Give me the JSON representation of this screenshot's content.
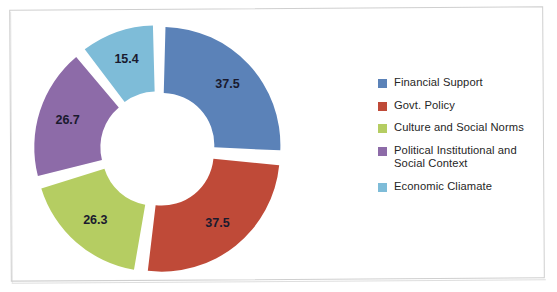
{
  "chart_data": {
    "type": "pie",
    "variant": "doughnut-exploded",
    "title": "",
    "subtitle": "",
    "xlabel": "",
    "ylabel": "",
    "grid": false,
    "legend_position": "right",
    "categories": [
      "Financial Support",
      "Govt. Policy",
      "Culture and Social Norms",
      "Political Institutional and Social Context",
      "Economic Cliamate"
    ],
    "values": [
      37.5,
      37.5,
      26.3,
      26.7,
      15.4
    ],
    "data_labels": [
      "37.5",
      "37.5",
      "26.3",
      "26.7",
      "15.4"
    ],
    "colors": [
      "#5B82B8",
      "#BF4A38",
      "#B5CD62",
      "#8D6BA8",
      "#7EBCD8"
    ],
    "total": 143.4,
    "start_angle_deg": 0,
    "direction": "clockwise",
    "hole_ratio": 0.44,
    "explode": true
  },
  "legend": {
    "items": [
      {
        "label": "Financial Support",
        "color": "#5B82B8"
      },
      {
        "label": "Govt. Policy",
        "color": "#BF4A38"
      },
      {
        "label": "Culture and Social Norms",
        "color": "#B5CD62"
      },
      {
        "label": "Political Institutional and\nSocial Context",
        "color": "#8D6BA8"
      },
      {
        "label": "Economic Cliamate",
        "color": "#7EBCD8"
      }
    ]
  },
  "slice_labels": {
    "financial_support": "37.5",
    "govt_policy": "37.5",
    "culture_and_social_norms": "26.3",
    "political_institutional": "26.7",
    "economic_climate": "15.4"
  }
}
